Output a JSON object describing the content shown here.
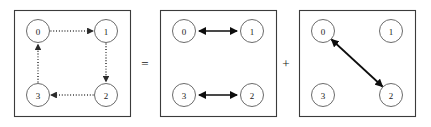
{
  "figure": {
    "background_color": "#ffffff",
    "frame_color": "#3b3b3b",
    "node_stroke_color": "#6b6b6b",
    "dotted_edge_color": "#2b2b2b",
    "solid_edge_color": "#0d0d0d"
  },
  "operators": [
    {
      "id": "equals",
      "symbol": "=",
      "x": 145,
      "y": 63
    },
    {
      "id": "plus",
      "symbol": "+",
      "x": 286,
      "y": 63
    }
  ],
  "panels": [
    {
      "id": "panel-cycle",
      "index": 0,
      "frame": {
        "x": 14,
        "y": 10,
        "width": 116,
        "height": 106
      },
      "edge_style": "dotted",
      "nodes": [
        {
          "id": "n0",
          "label": "0",
          "cx": 38,
          "cy": 31,
          "r": 11.5
        },
        {
          "id": "n1",
          "label": "1",
          "cx": 106,
          "cy": 31,
          "r": 11.5
        },
        {
          "id": "n3",
          "label": "3",
          "cx": 38,
          "cy": 95,
          "r": 11.5
        },
        {
          "id": "n2",
          "label": "2",
          "cx": 106,
          "cy": 95,
          "r": 11.5
        }
      ],
      "edges": [
        {
          "id": "e-0-1",
          "from": "0",
          "to": "1",
          "heads": "single",
          "direction": "right"
        },
        {
          "id": "e-1-2",
          "from": "1",
          "to": "2",
          "heads": "single",
          "direction": "down"
        },
        {
          "id": "e-2-3",
          "from": "2",
          "to": "3",
          "heads": "single",
          "direction": "left"
        },
        {
          "id": "e-3-0",
          "from": "3",
          "to": "0",
          "heads": "single",
          "direction": "up"
        }
      ]
    },
    {
      "id": "panel-horizontal-pairs",
      "index": 1,
      "frame": {
        "x": 160,
        "y": 10,
        "width": 116,
        "height": 106
      },
      "edge_style": "solid",
      "nodes": [
        {
          "id": "n0",
          "label": "0",
          "cx": 184,
          "cy": 31,
          "r": 11.5
        },
        {
          "id": "n1",
          "label": "1",
          "cx": 252,
          "cy": 31,
          "r": 11.5
        },
        {
          "id": "n3",
          "label": "3",
          "cx": 184,
          "cy": 95,
          "r": 11.5
        },
        {
          "id": "n2",
          "label": "2",
          "cx": 252,
          "cy": 95,
          "r": 11.5
        }
      ],
      "edges": [
        {
          "id": "e-0-1",
          "from": "0",
          "to": "1",
          "heads": "double",
          "direction": "horizontal"
        },
        {
          "id": "e-3-2",
          "from": "3",
          "to": "2",
          "heads": "double",
          "direction": "horizontal"
        }
      ]
    },
    {
      "id": "panel-diagonal",
      "index": 2,
      "frame": {
        "x": 299,
        "y": 10,
        "width": 116,
        "height": 106
      },
      "edge_style": "solid",
      "nodes": [
        {
          "id": "n0",
          "label": "0",
          "cx": 323,
          "cy": 31,
          "r": 11.5
        },
        {
          "id": "n1",
          "label": "1",
          "cx": 391,
          "cy": 31,
          "r": 11.5
        },
        {
          "id": "n3",
          "label": "3",
          "cx": 323,
          "cy": 95,
          "r": 11.5
        },
        {
          "id": "n2",
          "label": "2",
          "cx": 391,
          "cy": 95,
          "r": 11.5
        }
      ],
      "edges": [
        {
          "id": "e-0-2",
          "from": "0",
          "to": "2",
          "heads": "double",
          "direction": "diagonal"
        }
      ]
    }
  ]
}
